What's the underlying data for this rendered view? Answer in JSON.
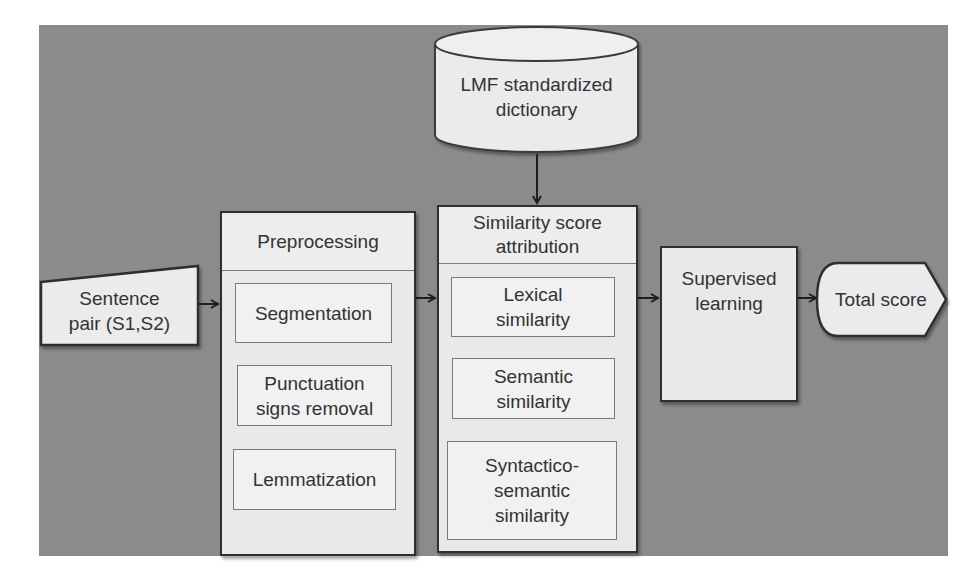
{
  "diagram": {
    "background_color": "#8b8b8b",
    "shape_fill": "#ebebeb",
    "stroke_color": "#2f2f2f",
    "nodes": {
      "input": {
        "shape": "manual-input",
        "label_line1": "Sentence",
        "label_line2": "pair (S1,S2)"
      },
      "dictionary": {
        "shape": "cylinder",
        "label_line1": "LMF standardized",
        "label_line2": "dictionary"
      },
      "preprocessing": {
        "title": "Preprocessing",
        "steps": [
          {
            "line1": "Segmentation",
            "line2": ""
          },
          {
            "line1": "Punctuation",
            "line2": "signs removal"
          },
          {
            "line1": "Lemmatization",
            "line2": ""
          }
        ]
      },
      "similarity": {
        "title_line1": "Similarity score",
        "title_line2": "attribution",
        "measures": [
          {
            "line1": "Lexical",
            "line2": "similarity",
            "line3": ""
          },
          {
            "line1": "Semantic",
            "line2": "similarity",
            "line3": ""
          },
          {
            "line1": "Syntactico-",
            "line2": "semantic",
            "line3": "similarity"
          }
        ]
      },
      "learning": {
        "label_line1": "Supervised",
        "label_line2": "learning"
      },
      "output": {
        "shape": "display",
        "label": "Total score"
      }
    },
    "edges": [
      {
        "from": "dictionary",
        "to": "similarity"
      },
      {
        "from": "input",
        "to": "preprocessing"
      },
      {
        "from": "preprocessing",
        "to": "similarity"
      },
      {
        "from": "similarity",
        "to": "learning"
      },
      {
        "from": "learning",
        "to": "output"
      }
    ]
  }
}
